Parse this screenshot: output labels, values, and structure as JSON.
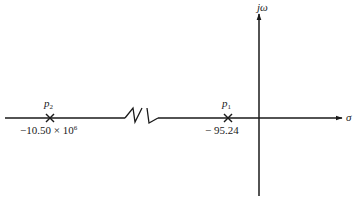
{
  "diagram": {
    "type": "s-plane pole plot",
    "axes": {
      "horizontal_label": "σ",
      "vertical_label": "jω"
    },
    "poles": [
      {
        "name": "p",
        "subscript": "2",
        "value_text": "−10.50 × 10",
        "value_exponent": "6",
        "value": -10500000
      },
      {
        "name": "p",
        "subscript": "1",
        "value_text": "− 95.24",
        "value": -95.24
      }
    ],
    "axis_break": "zigzag break in real axis between p2 and p1",
    "colors": {
      "ink": "#1a1a1a",
      "background": "#ffffff"
    }
  }
}
